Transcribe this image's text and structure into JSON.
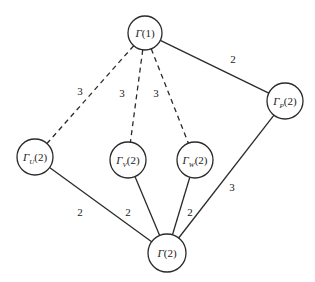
{
  "diagram": {
    "type": "weighted-graph",
    "nodes": [
      {
        "id": "g1",
        "symbol": "Γ",
        "subscript": "",
        "arg": "(1)"
      },
      {
        "id": "gu",
        "symbol": "Γ",
        "subscript": "U",
        "arg": "(2)"
      },
      {
        "id": "gv",
        "symbol": "Γ",
        "subscript": "V",
        "arg": "(2)"
      },
      {
        "id": "gw",
        "symbol": "Γ",
        "subscript": "W",
        "arg": "(2)"
      },
      {
        "id": "gp",
        "symbol": "Γ",
        "subscript": "P",
        "arg": "(2)"
      },
      {
        "id": "g2",
        "symbol": "Γ",
        "subscript": "",
        "arg": "(2)"
      }
    ],
    "edges": [
      {
        "from": "g1",
        "to": "gu",
        "weight": "3",
        "style": "dashed"
      },
      {
        "from": "g1",
        "to": "gv",
        "weight": "3",
        "style": "dashed"
      },
      {
        "from": "g1",
        "to": "gw",
        "weight": "3",
        "style": "dashed"
      },
      {
        "from": "g1",
        "to": "gp",
        "weight": "2",
        "style": "solid"
      },
      {
        "from": "gu",
        "to": "g2",
        "weight": "2",
        "style": "solid"
      },
      {
        "from": "gv",
        "to": "g2",
        "weight": "2",
        "style": "solid"
      },
      {
        "from": "gw",
        "to": "g2",
        "weight": "2",
        "style": "solid"
      },
      {
        "from": "gp",
        "to": "g2",
        "weight": "3",
        "style": "solid"
      }
    ]
  }
}
